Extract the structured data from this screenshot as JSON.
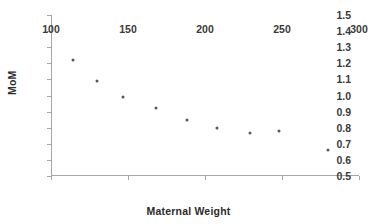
{
  "chart_data": {
    "type": "scatter",
    "title": "",
    "xlabel": "Maternal Weight",
    "ylabel": "MoM",
    "xlim": [
      100,
      300
    ],
    "ylim": [
      0.5,
      1.5
    ],
    "xticks": [
      "100",
      "150",
      "200",
      "250",
      "300"
    ],
    "xtick_values": [
      100,
      150,
      200,
      250,
      300
    ],
    "yticks": [
      "0.5",
      "0.6",
      "0.7",
      "0.8",
      "0.9",
      "1.0",
      "1.1",
      "1.2",
      "1.3",
      "1.4",
      "1.5"
    ],
    "ytick_values": [
      0.5,
      0.6,
      0.7,
      0.8,
      0.9,
      1.0,
      1.1,
      1.2,
      1.3,
      1.4,
      1.5
    ],
    "grid": false,
    "legend": false,
    "marker_color": "#595959",
    "axis_color": "#a6a6a6",
    "background": "#ffffff",
    "points": [
      {
        "x": 114,
        "y": 1.22
      },
      {
        "x": 130,
        "y": 1.09
      },
      {
        "x": 147,
        "y": 0.99
      },
      {
        "x": 168,
        "y": 0.92
      },
      {
        "x": 188,
        "y": 0.85
      },
      {
        "x": 208,
        "y": 0.8
      },
      {
        "x": 229,
        "y": 0.77
      },
      {
        "x": 248,
        "y": 0.78
      },
      {
        "x": 280,
        "y": 0.66
      }
    ],
    "x": [
      114,
      130,
      147,
      168,
      188,
      208,
      229,
      248,
      280
    ],
    "values": [
      1.22,
      1.09,
      0.99,
      0.92,
      0.85,
      0.8,
      0.77,
      0.78,
      0.66
    ]
  }
}
